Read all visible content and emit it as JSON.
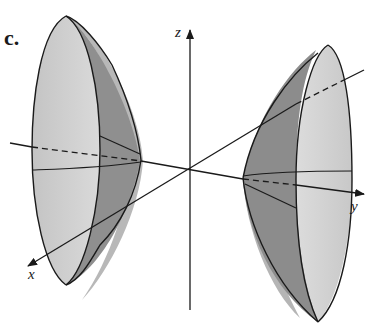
{
  "figure": {
    "part_label": "c.",
    "axes": {
      "x": {
        "label": "x"
      },
      "y": {
        "label": "y"
      },
      "z": {
        "label": "z"
      }
    },
    "colors": {
      "light_surface": "#cfcfcf",
      "dark_surface": "#8f8f8f",
      "shadow": "#9c9c9c",
      "line": "#1a1a1a",
      "background": "#ffffff"
    }
  }
}
